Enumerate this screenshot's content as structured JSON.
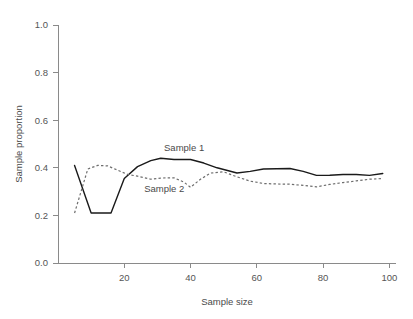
{
  "chart_data": {
    "type": "line",
    "title": "",
    "xlabel": "Sample size",
    "ylabel": "Sample proportion",
    "xlim": [
      0,
      102
    ],
    "ylim": [
      0.0,
      1.0
    ],
    "xticks": [
      20,
      40,
      60,
      80,
      100
    ],
    "yticks": [
      "0.0",
      "0.2",
      "0.4",
      "0.6",
      "0.8",
      "1.0"
    ],
    "ytick_values": [
      0.0,
      0.2,
      0.4,
      0.6,
      0.8,
      1.0
    ],
    "grid": false,
    "legend": "inline-annotations",
    "annotations": [
      {
        "text": "Sample 1",
        "x": 32,
        "y": 0.47
      },
      {
        "text": "Sample 2",
        "x": 26,
        "y": 0.3
      }
    ],
    "series": [
      {
        "name": "Sample 1",
        "style": "solid",
        "color": "#1a1a1a",
        "x": [
          5,
          10,
          12,
          16,
          20,
          24,
          28,
          31,
          35,
          40,
          44,
          48,
          54,
          58,
          62,
          66,
          70,
          74,
          78,
          82,
          86,
          90,
          94,
          98
        ],
        "values": [
          0.41,
          0.21,
          0.21,
          0.21,
          0.355,
          0.405,
          0.43,
          0.44,
          0.435,
          0.435,
          0.42,
          0.4,
          0.378,
          0.385,
          0.395,
          0.396,
          0.397,
          0.385,
          0.368,
          0.369,
          0.372,
          0.372,
          0.368,
          0.376
        ]
      },
      {
        "name": "Sample 2",
        "style": "dashed",
        "color": "#6e6e6e",
        "x": [
          5,
          9,
          12,
          15,
          18,
          21,
          24,
          28,
          31,
          35,
          38,
          40,
          43,
          46,
          50,
          54,
          58,
          62,
          66,
          70,
          74,
          78,
          82,
          86,
          90,
          94,
          98
        ],
        "values": [
          0.21,
          0.395,
          0.41,
          0.408,
          0.39,
          0.372,
          0.365,
          0.352,
          0.357,
          0.358,
          0.34,
          0.318,
          0.352,
          0.378,
          0.383,
          0.362,
          0.344,
          0.334,
          0.332,
          0.331,
          0.326,
          0.32,
          0.33,
          0.338,
          0.345,
          0.352,
          0.355
        ]
      }
    ]
  },
  "axes": {
    "y_label": "Sample proportion",
    "x_label": "Sample size"
  }
}
